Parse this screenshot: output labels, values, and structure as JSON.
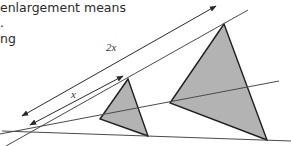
{
  "text": {
    "line1": "enlargement means",
    "line2": ".",
    "line3": "ng"
  },
  "diagram": {
    "label_long": "2x",
    "label_short": "x",
    "colors": {
      "line": "#3a3a3a",
      "triangle_fill": "#b3b3b3",
      "triangle_stroke": "#1e1e1e"
    },
    "small_triangle": [
      [
        128,
        79
      ],
      [
        100,
        119
      ],
      [
        148,
        136
      ]
    ],
    "large_triangle": [
      [
        224,
        24
      ],
      [
        170,
        103
      ],
      [
        267,
        140
      ]
    ]
  }
}
